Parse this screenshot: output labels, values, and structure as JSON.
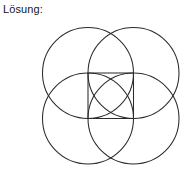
{
  "caption": {
    "text": "Lösung:"
  },
  "figure": {
    "name": "four-overlapping-circles-with-inscribed-square",
    "background_color": "#ffffff",
    "stroke_color": "#2b2b2b",
    "stroke_width": 1.05,
    "view_box": "0 0 194 188",
    "square": {
      "label": "central-square",
      "x": 88,
      "y": 73,
      "width": 45.5,
      "height": 45.5,
      "corners": [
        [
          88,
          73
        ],
        [
          133.5,
          73
        ],
        [
          133.5,
          118.5
        ],
        [
          88,
          118.5
        ]
      ]
    },
    "circles": [
      {
        "label": "circle-top-left",
        "cx": 88,
        "cy": 73,
        "r": 45.5
      },
      {
        "label": "circle-top-right",
        "cx": 133.5,
        "cy": 73,
        "r": 45.5
      },
      {
        "label": "circle-bottom-left",
        "cx": 88,
        "cy": 118.5,
        "r": 45.5
      },
      {
        "label": "circle-bottom-right",
        "cx": 133.5,
        "cy": 118.5,
        "r": 45.5
      }
    ]
  }
}
